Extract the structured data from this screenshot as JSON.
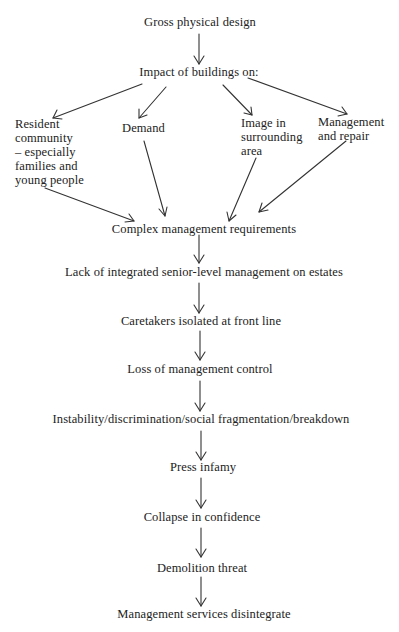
{
  "diagram": {
    "type": "flowchart",
    "direction": "top-to-bottom",
    "colors": {
      "text": "#222222",
      "arrow": "#333333",
      "background": "#ffffff"
    },
    "nodes": {
      "gross_design": "Gross physical design",
      "impact": "Impact of buildings on:",
      "resident": "Resident\ncommunity\n – especially\nfamilies and\nyoung people",
      "demand": "Demand",
      "image": "Image in\nsurrounding\narea",
      "management_repair": "Management\nand repair",
      "complex": "Complex management requirements",
      "lack": "Lack of integrated senior-level management on estates",
      "caretakers": "Caretakers isolated at front line",
      "loss": "Loss of management control",
      "instability": "Instability/discrimination/social fragmentation/breakdown",
      "press": "Press infamy",
      "collapse": "Collapse in confidence",
      "demolition": "Demolition threat",
      "disintegrate": "Management services disintegrate"
    },
    "edges": [
      {
        "from": "gross_design",
        "to": "impact"
      },
      {
        "from": "impact",
        "to": "resident"
      },
      {
        "from": "impact",
        "to": "demand"
      },
      {
        "from": "impact",
        "to": "image"
      },
      {
        "from": "impact",
        "to": "management_repair"
      },
      {
        "from": "resident",
        "to": "complex"
      },
      {
        "from": "demand",
        "to": "complex"
      },
      {
        "from": "image",
        "to": "complex"
      },
      {
        "from": "management_repair",
        "to": "complex"
      },
      {
        "from": "complex",
        "to": "lack"
      },
      {
        "from": "lack",
        "to": "caretakers"
      },
      {
        "from": "caretakers",
        "to": "loss"
      },
      {
        "from": "loss",
        "to": "instability"
      },
      {
        "from": "instability",
        "to": "press"
      },
      {
        "from": "press",
        "to": "collapse"
      },
      {
        "from": "collapse",
        "to": "demolition"
      },
      {
        "from": "demolition",
        "to": "disintegrate"
      }
    ]
  }
}
